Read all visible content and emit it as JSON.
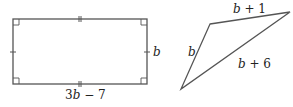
{
  "rectangle": {
    "side_label": "b",
    "bottom_label_coef": "3",
    "bottom_label_var": "b",
    "bottom_label_rest": " − 7",
    "stroke": "#555555"
  },
  "triangle": {
    "left_label": "b",
    "top_label_var": "b",
    "top_label_rest": " + 1",
    "long_label_var": "b",
    "long_label_rest": " + 6",
    "stroke": "#555555"
  }
}
